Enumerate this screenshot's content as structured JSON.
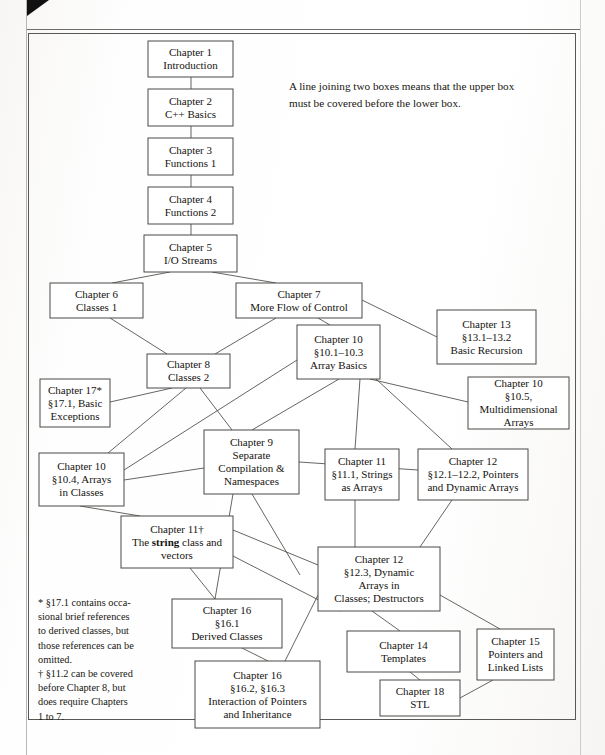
{
  "page": {
    "background_color": "#ffffff",
    "frame_color": "#5a5854",
    "text_color": "#15130f",
    "line_color": "#55534f"
  },
  "caption": {
    "text": "A line joining two boxes means that the upper box must be covered before the lower box."
  },
  "footnote": {
    "line1": "* §17.1 contains occa-",
    "line2": "sional brief references",
    "line3": "to derived classes, but",
    "line4": "those references can be",
    "line5": "omitted.",
    "line6": "† §11.2 can be covered",
    "line7": "before Chapter 8, but",
    "line8": "does require Chapters",
    "line9": "1 to 7."
  },
  "chart_data": {
    "type": "diagram",
    "nodes": [
      {
        "id": "ch1",
        "x": 148,
        "y": 41,
        "w": 85,
        "h": 36,
        "lines": [
          "Chapter 1",
          "Introduction"
        ]
      },
      {
        "id": "ch2",
        "x": 148,
        "y": 89,
        "w": 85,
        "h": 37,
        "lines": [
          "Chapter 2",
          "C++ Basics"
        ]
      },
      {
        "id": "ch3",
        "x": 148,
        "y": 138,
        "w": 85,
        "h": 37,
        "lines": [
          "Chapter 3",
          "Functions 1"
        ]
      },
      {
        "id": "ch4",
        "x": 148,
        "y": 187,
        "w": 85,
        "h": 37,
        "lines": [
          "Chapter 4",
          "Functions 2"
        ]
      },
      {
        "id": "ch5",
        "x": 144,
        "y": 235,
        "w": 93,
        "h": 37,
        "lines": [
          "Chapter 5",
          "I/O Streams"
        ]
      },
      {
        "id": "ch6",
        "x": 50,
        "y": 283,
        "w": 93,
        "h": 35,
        "lines": [
          "Chapter 6",
          "Classes 1"
        ]
      },
      {
        "id": "ch7",
        "x": 236,
        "y": 283,
        "w": 126,
        "h": 35,
        "lines": [
          "Chapter 7",
          "More Flow of Control"
        ]
      },
      {
        "id": "ch13",
        "x": 437,
        "y": 310,
        "w": 99,
        "h": 54,
        "lines": [
          "Chapter 13",
          "§13.1–13.2",
          "Basic Recursion"
        ]
      },
      {
        "id": "ch10a",
        "x": 297,
        "y": 325,
        "w": 83,
        "h": 54,
        "lines": [
          "Chapter 10",
          "§10.1–10.3",
          "Array Basics"
        ]
      },
      {
        "id": "ch8",
        "x": 147,
        "y": 354,
        "w": 83,
        "h": 34,
        "lines": [
          "Chapter 8",
          "Classes 2"
        ]
      },
      {
        "id": "ch10b",
        "x": 468,
        "y": 377,
        "w": 101,
        "h": 52,
        "lines": [
          "Chapter 10",
          "§10.5,",
          "Multidimensional",
          "Arrays"
        ]
      },
      {
        "id": "ch17",
        "x": 40,
        "y": 379,
        "w": 70,
        "h": 48,
        "lines": [
          "Chapter 17*",
          "§17.1, Basic",
          "Exceptions"
        ]
      },
      {
        "id": "ch9",
        "x": 204,
        "y": 430,
        "w": 95,
        "h": 64,
        "lines": [
          "Chapter 9",
          "Separate",
          "Compilation &",
          "Namespaces"
        ]
      },
      {
        "id": "ch11a",
        "x": 325,
        "y": 449,
        "w": 74,
        "h": 51,
        "lines": [
          "Chapter 11",
          "§11.1, Strings",
          "as Arrays"
        ]
      },
      {
        "id": "ch12a",
        "x": 418,
        "y": 449,
        "w": 110,
        "h": 51,
        "lines": [
          "Chapter 12",
          "§12.1–12.2, Pointers",
          "and Dynamic Arrays"
        ]
      },
      {
        "id": "ch10c",
        "x": 39,
        "y": 453,
        "w": 85,
        "h": 53,
        "lines": [
          "Chapter 10",
          "§10.4, Arrays",
          "in Classes"
        ]
      },
      {
        "id": "ch11b",
        "x": 121,
        "y": 516,
        "w": 112,
        "h": 52,
        "lines": [
          "Chapter 11†",
          "The string class and",
          "vectors"
        ],
        "bold_word": "string"
      },
      {
        "id": "ch12b",
        "x": 318,
        "y": 547,
        "w": 122,
        "h": 64,
        "lines": [
          "Chapter 12",
          "§12.3, Dynamic",
          "Arrays in",
          "Classes; Destructors"
        ]
      },
      {
        "id": "ch16a",
        "x": 172,
        "y": 599,
        "w": 110,
        "h": 49,
        "lines": [
          "Chapter 16",
          "§16.1",
          "Derived Classes"
        ]
      },
      {
        "id": "ch14",
        "x": 347,
        "y": 631,
        "w": 113,
        "h": 41,
        "lines": [
          "Chapter 14",
          "Templates"
        ]
      },
      {
        "id": "ch15",
        "x": 477,
        "y": 629,
        "w": 77,
        "h": 51,
        "lines": [
          "Chapter 15",
          "Pointers and",
          "Linked Lists"
        ]
      },
      {
        "id": "ch16b",
        "x": 195,
        "y": 661,
        "w": 125,
        "h": 67,
        "lines": [
          "Chapter 16",
          "§16.2, §16.3",
          "Interaction of Pointers",
          "and Inheritance"
        ]
      },
      {
        "id": "ch18",
        "x": 380,
        "y": 680,
        "w": 80,
        "h": 36,
        "lines": [
          "Chapter 18",
          "STL"
        ]
      }
    ],
    "edges": [
      {
        "from": [
          191,
          77
        ],
        "to": [
          191,
          89
        ]
      },
      {
        "from": [
          191,
          126
        ],
        "to": [
          191,
          138
        ]
      },
      {
        "from": [
          191,
          175
        ],
        "to": [
          191,
          187
        ]
      },
      {
        "from": [
          191,
          224
        ],
        "to": [
          191,
          235
        ]
      },
      {
        "from": [
          170,
          272
        ],
        "to": [
          112,
          283
        ]
      },
      {
        "from": [
          212,
          272
        ],
        "to": [
          276,
          283
        ]
      },
      {
        "from": [
          110,
          318
        ],
        "to": [
          167,
          354
        ]
      },
      {
        "from": [
          276,
          318
        ],
        "to": [
          215,
          354
        ]
      },
      {
        "from": [
          362,
          300
        ],
        "to": [
          437,
          337
        ]
      },
      {
        "from": [
          318,
          318
        ],
        "to": [
          330,
          325
        ]
      },
      {
        "from": [
          172,
          388
        ],
        "to": [
          110,
          402
        ]
      },
      {
        "from": [
          186,
          388
        ],
        "to": [
          108,
          453
        ]
      },
      {
        "from": [
          200,
          388
        ],
        "to": [
          232,
          430
        ]
      },
      {
        "from": [
          297,
          360
        ],
        "to": [
          124,
          470
        ]
      },
      {
        "from": [
          339,
          379
        ],
        "to": [
          252,
          430
        ]
      },
      {
        "from": [
          360,
          379
        ],
        "to": [
          355,
          449
        ]
      },
      {
        "from": [
          370,
          379
        ],
        "to": [
          468,
          402
        ]
      },
      {
        "from": [
          376,
          379
        ],
        "to": [
          452,
          449
        ]
      },
      {
        "from": [
          299,
          462
        ],
        "to": [
          418,
          470
        ]
      },
      {
        "from": [
          124,
          480
        ],
        "to": [
          204,
          468
        ]
      },
      {
        "from": [
          80,
          506
        ],
        "to": [
          140,
          516
        ]
      },
      {
        "from": [
          233,
          530
        ],
        "to": [
          318,
          565
        ]
      },
      {
        "from": [
          233,
          556
        ],
        "to": [
          340,
          611
        ]
      },
      {
        "from": [
          252,
          494
        ],
        "to": [
          300,
          575
        ]
      },
      {
        "from": [
          233,
          494
        ],
        "to": [
          215,
          599
        ]
      },
      {
        "from": [
          355,
          500
        ],
        "to": [
          355,
          547
        ]
      },
      {
        "from": [
          452,
          500
        ],
        "to": [
          420,
          547
        ]
      },
      {
        "from": [
          190,
          568
        ],
        "to": [
          215,
          599
        ]
      },
      {
        "from": [
          242,
          648
        ],
        "to": [
          268,
          661
        ]
      },
      {
        "from": [
          318,
          595
        ],
        "to": [
          285,
          661
        ]
      },
      {
        "from": [
          372,
          611
        ],
        "to": [
          400,
          631
        ]
      },
      {
        "from": [
          440,
          595
        ],
        "to": [
          500,
          629
        ]
      },
      {
        "from": [
          410,
          672
        ],
        "to": [
          420,
          680
        ]
      },
      {
        "from": [
          460,
          698
        ],
        "to": [
          493,
          680
        ]
      }
    ],
    "caption_note": "A line joining two boxes means that the upper box must be covered before the lower box.",
    "legend_position": "top-right",
    "grid": false
  }
}
